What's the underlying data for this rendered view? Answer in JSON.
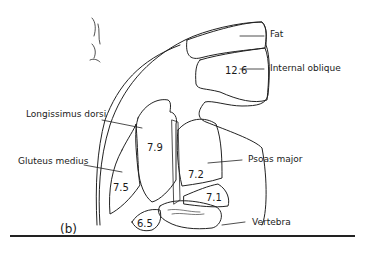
{
  "figure": {
    "panel_label": "(b)",
    "labels": {
      "fat": "Fat",
      "internal_oblique": "Internal oblique",
      "longissimus_dorsi": "Longissimus dorsi",
      "gluteus_medius": "Gluteus medius",
      "psoas_major": "Psoas major",
      "vertebra": "Vertebra"
    },
    "values": {
      "internal_oblique": "12.6",
      "longissimus_dorsi": "7.9",
      "gluteus_medius": "7.5",
      "psoas_major": "7.2",
      "small_muscle": "7.1",
      "bottom_muscle": "6.5"
    }
  }
}
